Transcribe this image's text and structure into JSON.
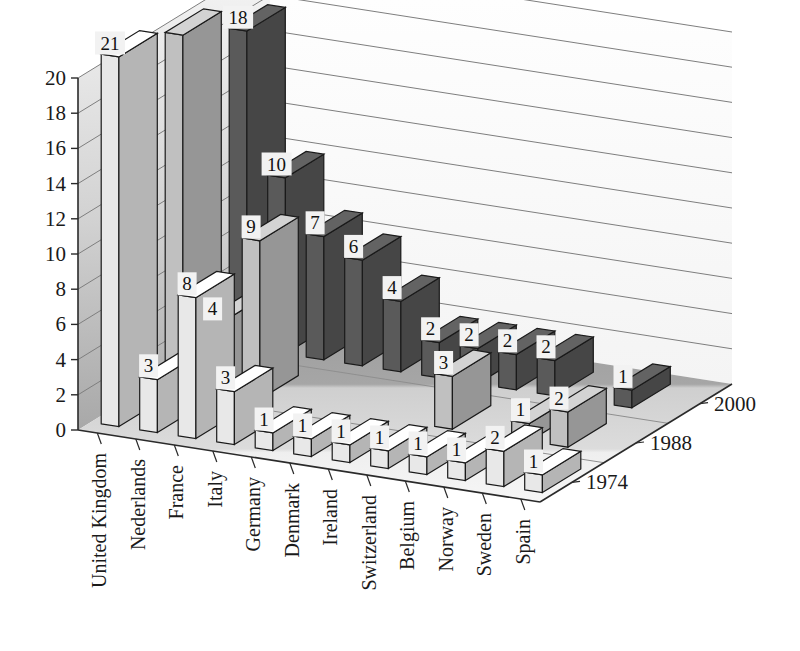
{
  "chart_data": {
    "type": "bar",
    "title": "",
    "subtitle": "",
    "xlabel": "",
    "ylabel": "",
    "zlabel": "",
    "three_d": true,
    "grid": true,
    "legend_position": "depth-axis-right",
    "ylim": [
      0,
      20
    ],
    "ytick_labels": [
      "0",
      "2",
      "4",
      "6",
      "8",
      "10",
      "12",
      "14",
      "16",
      "18",
      "20"
    ],
    "ytick_values": [
      0,
      2,
      4,
      6,
      8,
      10,
      12,
      14,
      16,
      18,
      20
    ],
    "categories": [
      "United Kingdom",
      "Nederlands",
      "France",
      "Italy",
      "Germany",
      "Denmark",
      "Ireland",
      "Switzerland",
      "Belgium",
      "Norway",
      "Sweden",
      "Spain"
    ],
    "depth_categories": [
      "1974",
      "1988",
      "2000"
    ],
    "series": [
      {
        "name": "1974",
        "color": "#e8e8e8",
        "values": [
          21,
          3,
          8,
          3,
          1,
          1,
          1,
          1,
          1,
          1,
          2,
          1
        ],
        "labels": [
          "21",
          "3",
          "8",
          "3",
          "1",
          "1",
          "1",
          "1",
          "1",
          "1",
          "2",
          "1"
        ]
      },
      {
        "name": "1988",
        "color": "#c0c0c0",
        "values": [
          20,
          4,
          9,
          0,
          0,
          0,
          0,
          3,
          0,
          1,
          2,
          0
        ],
        "labels": [
          "",
          "4",
          "9",
          "",
          "",
          "",
          "",
          "3",
          "",
          "1",
          "2",
          ""
        ]
      },
      {
        "name": "2000",
        "color": "#5a5a5a",
        "values": [
          18,
          10,
          7,
          6,
          4,
          2,
          2,
          2,
          2,
          0,
          1,
          0
        ],
        "labels": [
          "18",
          "10",
          "7",
          "6",
          "4",
          "2",
          "2",
          "2",
          "2",
          "",
          "1",
          ""
        ]
      }
    ]
  },
  "palette": {
    "back_wall": "#fbfbfb",
    "left_wall_top": "#f4f4f4",
    "left_wall_bottom": "#b4b4b4",
    "floor_light": "#eeeeee",
    "floor_mid": "#c8c8c8",
    "floor_dark": "#9a9a9a",
    "gridline": "#8a8a8a",
    "axis_line": "#2a2a2a",
    "series_1974": "#e8e8e8",
    "series_1988": "#c0c0c0",
    "series_2000": "#5a5a5a",
    "bar_outline": "#1a1a1a",
    "label_box": "#f2f2f2",
    "text": "#1a1a1a"
  }
}
